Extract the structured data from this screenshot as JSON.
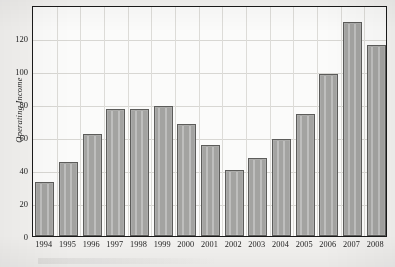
{
  "chart_data": {
    "type": "bar",
    "title": "",
    "xlabel": "",
    "ylabel": "Operating Income",
    "categories": [
      "1994",
      "1995",
      "1996",
      "1997",
      "1998",
      "1999",
      "2000",
      "2001",
      "2002",
      "2003",
      "2004",
      "2005",
      "2006",
      "2007",
      "2008"
    ],
    "values": [
      33,
      45,
      62,
      77,
      77,
      79,
      68,
      55,
      40,
      47,
      59,
      74,
      98,
      130,
      116
    ],
    "ylim": [
      0,
      140
    ],
    "yticks": [
      0,
      20,
      40,
      60,
      80,
      100,
      120
    ],
    "ytick_labels": [
      "0",
      "20",
      "40",
      "60",
      "80",
      "100",
      "120"
    ],
    "grid": true,
    "legend": null,
    "series": [
      {
        "name": "Operating Income",
        "values": [
          33,
          45,
          62,
          77,
          77,
          79,
          68,
          55,
          40,
          47,
          59,
          74,
          98,
          130,
          116
        ]
      }
    ],
    "colors": {
      "bar_fill": "#a3a3a1",
      "bar_border": "#5c5c5a",
      "grid": "#d8d7d3",
      "frame": "#1a1a1a",
      "plot_background": "#fbfbfa",
      "page_background": "#f3f2f0",
      "text": "#1d1d1d"
    }
  }
}
